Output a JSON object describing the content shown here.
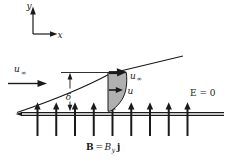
{
  "figure": {
    "axes": {
      "y_label": "y",
      "x_label": "x"
    },
    "freestream": {
      "u_base": "u",
      "u_sub": "∞"
    },
    "boundary_layer": {
      "thickness_label": "δ"
    },
    "velocity_profile": {
      "top_base": "u",
      "top_sub": "∞",
      "mid_label": "u"
    },
    "electric_field": {
      "label": "E = 0"
    },
    "magnetic_field": {
      "B_vector": "B",
      "equals": "=",
      "B_component": "B",
      "component_sub": "y",
      "unit_vector": "j"
    },
    "field_arrow_count": 9,
    "colors": {
      "ink": "#1a1a1a",
      "profile_fill": "#b0b0b0",
      "background": "#ffffff"
    }
  }
}
